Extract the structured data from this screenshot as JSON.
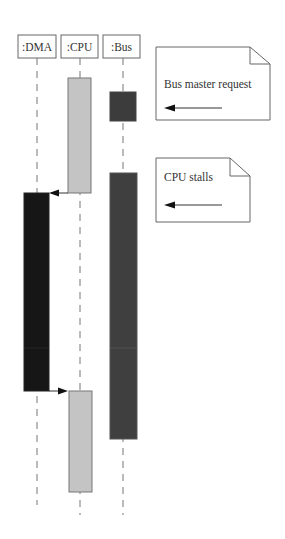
{
  "diagram": {
    "type": "sequence",
    "participants": [
      {
        "id": "dma",
        "label": ":DMA",
        "box": {
          "x": 18,
          "y": 35,
          "w": 38,
          "h": 23
        },
        "lifeline_x": 37
      },
      {
        "id": "cpu",
        "label": ":CPU",
        "box": {
          "x": 61,
          "y": 35,
          "w": 37,
          "h": 23
        },
        "lifeline_x": 80
      },
      {
        "id": "bus",
        "label": ":Bus",
        "box": {
          "x": 103,
          "y": 35,
          "w": 37,
          "h": 23
        },
        "lifeline_x": 123
      }
    ],
    "lifeline_end_y": {
      "dma": 505,
      "cpu": 515,
      "bus": 515
    },
    "activations": [
      {
        "participant": "cpu",
        "x": 68,
        "y": 78,
        "w": 23,
        "h": 115,
        "color": "#c4c4c4"
      },
      {
        "participant": "bus",
        "x": 110,
        "y": 92,
        "w": 26,
        "h": 29,
        "color": "#3c3c3c"
      },
      {
        "participant": "bus",
        "x": 110,
        "y": 173,
        "w": 27,
        "h": 266,
        "color": "#3f3f3f"
      },
      {
        "participant": "dma",
        "x": 24,
        "y": 193,
        "w": 25,
        "h": 198,
        "color": "#161616"
      },
      {
        "participant": "cpu",
        "x": 69,
        "y": 391,
        "w": 23,
        "h": 101,
        "color": "#c4c4c4"
      }
    ],
    "messages": [
      {
        "from": "cpu",
        "to": "dma",
        "y": 193,
        "x1": 68,
        "x2": 49
      },
      {
        "from": "dma",
        "to": "cpu",
        "y": 391,
        "x1": 49,
        "x2": 69
      }
    ],
    "notes": [
      {
        "id": "note-bus-master",
        "text": "Bus master request",
        "x": 156,
        "y": 47,
        "w": 114,
        "h": 73,
        "fold": 20,
        "arrow_y": 108,
        "arrow_x1": 165,
        "arrow_x2": 222
      },
      {
        "id": "note-cpu-stalls",
        "text": "CPU stalls",
        "x": 156,
        "y": 158,
        "w": 94,
        "h": 64,
        "fold": 20,
        "arrow_y": 205,
        "arrow_x1": 165,
        "arrow_x2": 222
      }
    ],
    "colors": {
      "line": "#555555",
      "dashed": "#777777",
      "cpu_bar": "#c4c4c4",
      "bus_bar": "#3f3f3f",
      "dma_bar": "#161616"
    }
  }
}
